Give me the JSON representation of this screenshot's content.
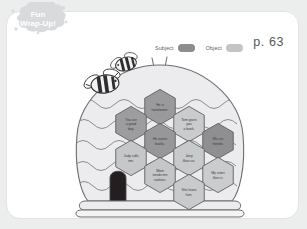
{
  "badge": {
    "line1": "Fun",
    "line2": "Wrap-Up!"
  },
  "legend": {
    "subject": {
      "label": "Subject",
      "color": "#8d8d8f"
    },
    "object": {
      "label": "Object",
      "color": "#c3c4c6"
    }
  },
  "page": {
    "number": "p. 63"
  },
  "worksheet": {
    "title": "Beehive sentence sort",
    "hive_color": "#eceeee",
    "hexagons": [
      {
        "id": "hex-he-is-handsome",
        "lines": [
          "He is",
          "handsome."
        ],
        "type": "subject",
        "cx": 153,
        "cy": 95,
        "fill": "#9a9a9c"
      },
      {
        "id": "hex-you-are-a-good-boy",
        "lines": [
          "You are",
          "a good",
          "boy."
        ],
        "type": "subject",
        "cx": 124,
        "cy": 112,
        "fill": "#9d9d9f"
      },
      {
        "id": "hex-tom-gives-you-a-book",
        "lines": [
          "Tom gives",
          "you",
          "a book."
        ],
        "type": "object",
        "cx": 182,
        "cy": 112,
        "fill": "#cacbcd"
      },
      {
        "id": "hex-he-wants-books",
        "lines": [
          "He wants",
          "books."
        ],
        "type": "subject",
        "cx": 153,
        "cy": 129,
        "fill": "#97979a"
      },
      {
        "id": "hex-we-are-friends",
        "lines": [
          "We are",
          "friends."
        ],
        "type": "subject",
        "cx": 211,
        "cy": 129,
        "fill": "#8f8f92"
      },
      {
        "id": "hex-judy-calls-me",
        "lines": [
          "Judy calls",
          "me."
        ],
        "type": "object",
        "cx": 124,
        "cy": 146,
        "fill": "#c6c7c9"
      },
      {
        "id": "hex-joey-likes-us",
        "lines": [
          "Joey",
          "likes us."
        ],
        "type": "object",
        "cx": 182,
        "cy": 146,
        "fill": "#c8c9cb"
      },
      {
        "id": "hex-mom-sends-me-cookies",
        "lines": [
          "Mom",
          "sends me",
          "cookies."
        ],
        "type": "object",
        "cx": 153,
        "cy": 163,
        "fill": "#c5c6c8"
      },
      {
        "id": "hex-my-sister-likes-it",
        "lines": [
          "My sister",
          "likes it."
        ],
        "type": "object",
        "cx": 211,
        "cy": 163,
        "fill": "#cbccce"
      },
      {
        "id": "hex-she-loves-him",
        "lines": [
          "She loves",
          "him."
        ],
        "type": "object",
        "cx": 182,
        "cy": 180,
        "fill": "#c9cacc"
      }
    ],
    "bees": [
      {
        "id": "bee-upper",
        "cx": 119,
        "cy": 52
      },
      {
        "id": "bee-lower",
        "cx": 98,
        "cy": 72
      }
    ]
  }
}
